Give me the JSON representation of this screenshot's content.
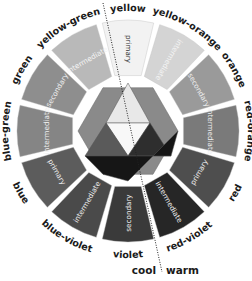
{
  "segments": [
    {
      "name": "yellow",
      "type": "primary",
      "fill": "#f2f2f2",
      "text": "#333333"
    },
    {
      "name": "yellow-orange",
      "type": "intermediate",
      "fill": "#d4d4d4",
      "text": "#f4f4f4"
    },
    {
      "name": "orange",
      "type": "secondary",
      "fill": "#9a9a9a",
      "text": "#eeeeee"
    },
    {
      "name": "red-orange",
      "type": "intermediate",
      "fill": "#7a7a7a",
      "text": "#eeeeee"
    },
    {
      "name": "red",
      "type": "primary",
      "fill": "#4e4e4e",
      "text": "#eeeeee"
    },
    {
      "name": "red-violet",
      "type": "intermediate",
      "fill": "#262626",
      "text": "#eeeeee"
    },
    {
      "name": "violet",
      "type": "secondary",
      "fill": "#3a3a3a",
      "text": "#eeeeee"
    },
    {
      "name": "blue-violet",
      "type": "intermediate",
      "fill": "#4a4a4a",
      "text": "#eeeeee"
    },
    {
      "name": "blue",
      "type": "primary",
      "fill": "#5c5c5c",
      "text": "#eeeeee"
    },
    {
      "name": "blue-green",
      "type": "intermediate",
      "fill": "#858585",
      "text": "#eeeeee"
    },
    {
      "name": "green",
      "type": "secondary",
      "fill": "#8e8e8e",
      "text": "#eeeeee"
    },
    {
      "name": "yellow-green",
      "type": "intermediate",
      "fill": "#b9b9b9",
      "text": "#f4f4f4"
    }
  ],
  "center": {
    "hexagon_fill": "#8a8a8a",
    "top_triangle_fill": "#e8e8e8",
    "inner_triangle_fill": "#f8f8f8",
    "left_triangle_fill": "#5a5a5a",
    "right_triangle_fill": "#2e2e2e",
    "bottom_fill": "#161616"
  },
  "divider": {
    "cool_label": "cool",
    "warm_label": "warm"
  }
}
